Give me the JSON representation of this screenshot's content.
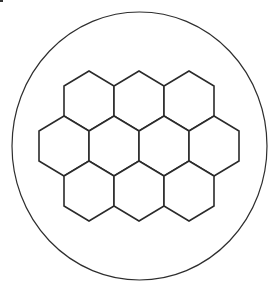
{
  "diagram": {
    "title": "",
    "container_shape": "circle",
    "cell_shape": "hexagon",
    "rows": [
      {
        "row": 1,
        "cells": 3
      },
      {
        "row": 2,
        "cells": 4
      },
      {
        "row": 3,
        "cells": 3
      }
    ],
    "total_cells": 10,
    "colors": {
      "stroke": "#2b2b2b",
      "fill": "#ffffff",
      "background": "#ffffff"
    }
  }
}
